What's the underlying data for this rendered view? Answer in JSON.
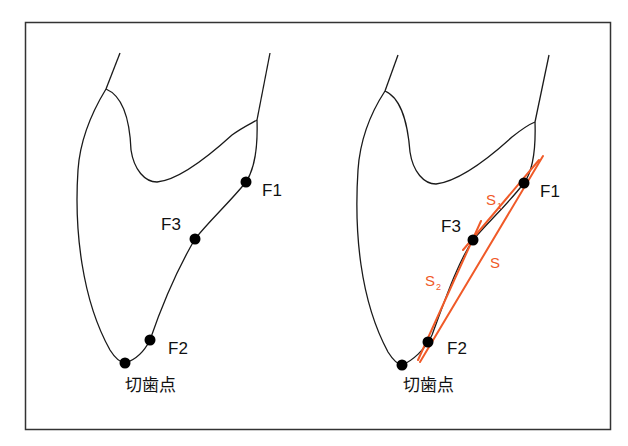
{
  "colors": {
    "outline": "#1a1a1a",
    "frame": "#333333",
    "accent": "#f05a28",
    "point": "#000000"
  },
  "left_panel": {
    "labels": {
      "f1": "F1",
      "f3": "F3",
      "f2": "F2",
      "incisal": "切歯点"
    }
  },
  "right_panel": {
    "labels": {
      "f1": "F1",
      "f3": "F3",
      "f2": "F2",
      "incisal": "切歯点",
      "s": "S",
      "s1_base": "S",
      "s1_sub": "1",
      "s2_base": "S",
      "s2_sub": "2"
    }
  }
}
